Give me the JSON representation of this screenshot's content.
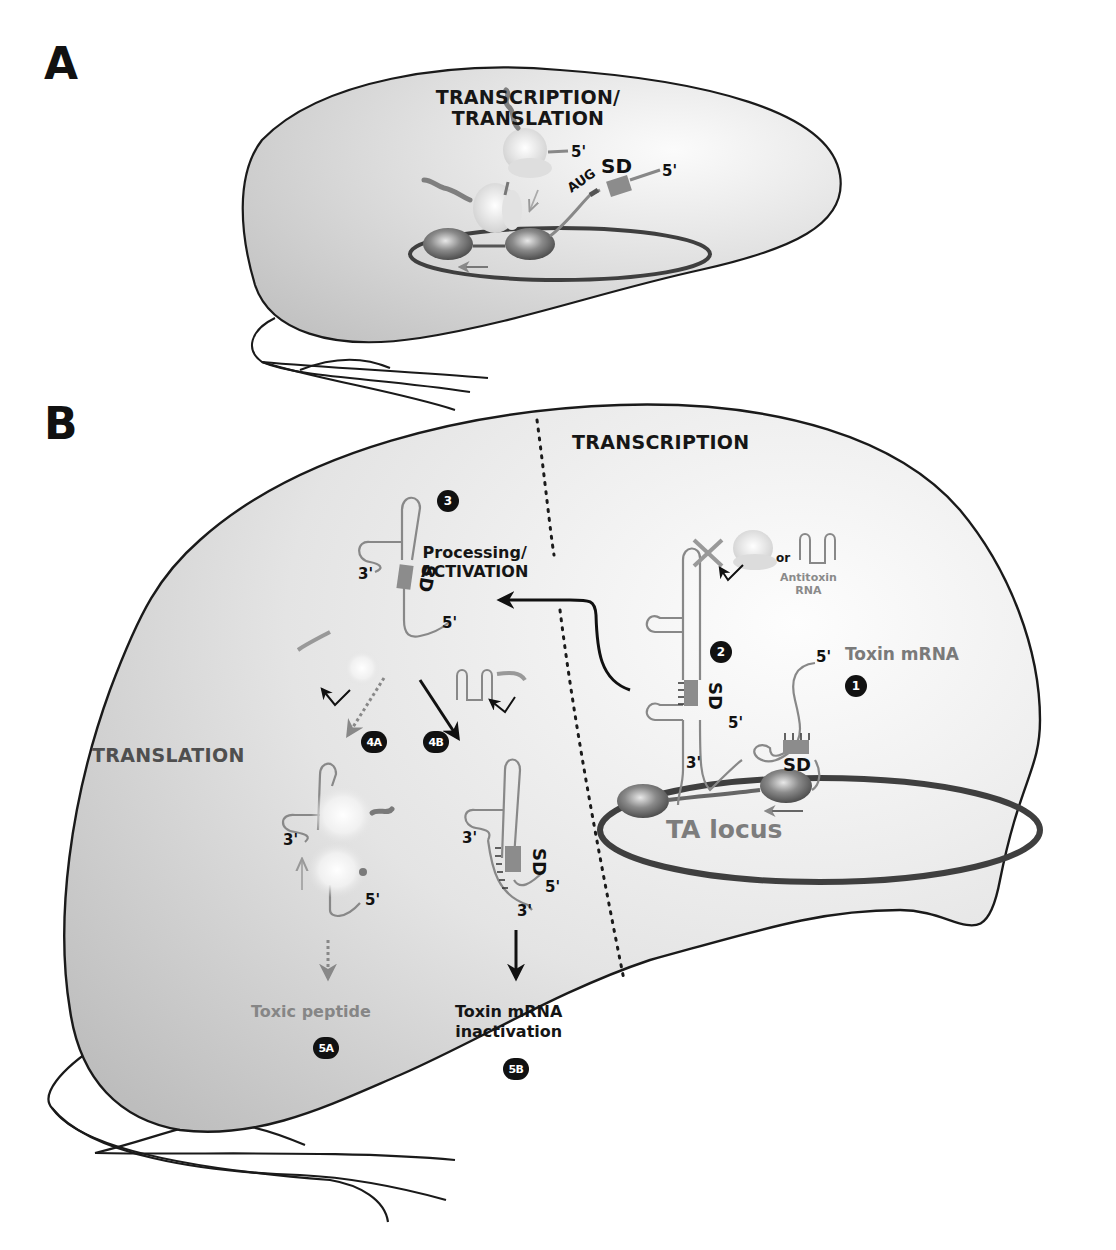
{
  "figure": {
    "panels": [
      {
        "id": "A",
        "letter": "A",
        "title_line1": "TRANSCRIPTION/",
        "title_line2": "TRANSLATION",
        "labels": {
          "ribosome_mrna_5prime": "5'",
          "mrna_5prime": "5'",
          "start_codon": "AUG",
          "shine_dalgarno": "SD"
        }
      },
      {
        "id": "B",
        "letter": "B",
        "region_transcription": "TRANSCRIPTION",
        "region_translation": "TRANSLATION",
        "processing_line1": "Processing/",
        "processing_line2": "ACTIVATION",
        "or_label": "or",
        "antitoxin_line1": "Antitoxin",
        "antitoxin_line2": "RNA",
        "toxin_mrna_label": "Toxin mRNA",
        "ta_locus_label": "TA locus",
        "outcome_5a": "Toxic peptide",
        "outcome_5b_line1": "Toxin mRNA",
        "outcome_5b_line2": "inactivation",
        "sd_label": "SD",
        "prime5": "5'",
        "prime3": "3'",
        "steps": [
          "1",
          "2",
          "3",
          "4A",
          "4B",
          "5A",
          "5B"
        ]
      }
    ],
    "colors": {
      "cell_fill_light": "#f4f4f4",
      "cell_fill_dark": "#c8c8c8",
      "outline": "#1a1a1a",
      "rna_grey": "#8a8a8a",
      "sd_box": "#8c8c8c",
      "dna_ring": "#4a4a4a",
      "badge": "#111111"
    },
    "icons": [
      "bacterium-cell-icon",
      "flagellum-icon",
      "ribosome-icon",
      "rna-hairpin-icon",
      "dna-plasmid-ring-icon",
      "rna-polymerase-icon",
      "inhibition-cross-icon",
      "arrow-icon"
    ]
  }
}
